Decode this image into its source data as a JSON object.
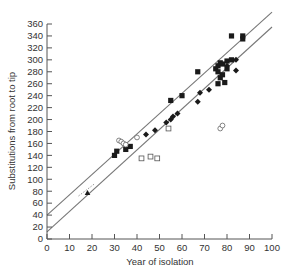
{
  "chart_data": {
    "type": "scatter",
    "title": "",
    "xlabel": "Year of isolation",
    "ylabel": "Substitutions from root to tip",
    "xlim": [
      0,
      100
    ],
    "ylim": [
      0,
      360
    ],
    "xticks": [
      0,
      10,
      20,
      30,
      40,
      50,
      60,
      70,
      80,
      90,
      100
    ],
    "yticks": [
      0,
      20,
      40,
      60,
      80,
      100,
      120,
      140,
      160,
      180,
      200,
      220,
      240,
      260,
      280,
      300,
      320,
      340,
      360
    ],
    "grid": false,
    "legend": null,
    "lines": [
      {
        "name": "upper-bound",
        "x": [
          0,
          100
        ],
        "y": [
          40,
          380
        ]
      },
      {
        "name": "lower-bound",
        "x": [
          0,
          100
        ],
        "y": [
          12,
          355
        ]
      }
    ],
    "series": [
      {
        "name": "filled-squares",
        "marker": "square-filled",
        "points": [
          [
            30,
            140
          ],
          [
            31,
            147
          ],
          [
            35,
            150
          ],
          [
            37,
            155
          ],
          [
            55,
            232
          ],
          [
            60,
            240
          ],
          [
            67,
            280
          ],
          [
            75,
            285
          ],
          [
            76,
            290
          ],
          [
            77,
            295
          ],
          [
            78,
            293
          ],
          [
            80,
            298
          ],
          [
            82,
            300
          ],
          [
            82,
            340
          ],
          [
            87,
            335
          ],
          [
            87,
            340
          ],
          [
            76,
            280
          ],
          [
            77,
            270
          ],
          [
            78,
            275
          ],
          [
            79,
            262
          ],
          [
            76,
            260
          ],
          [
            80,
            285
          ]
        ]
      },
      {
        "name": "filled-diamonds",
        "marker": "diamond-filled",
        "points": [
          [
            44,
            175
          ],
          [
            48,
            182
          ],
          [
            53,
            195
          ],
          [
            55,
            200
          ],
          [
            56,
            205
          ],
          [
            58,
            210
          ],
          [
            67,
            230
          ],
          [
            68,
            245
          ],
          [
            72,
            250
          ],
          [
            80,
            290
          ],
          [
            84,
            300
          ],
          [
            84,
            282
          ]
        ]
      },
      {
        "name": "open-circles",
        "marker": "circle-open",
        "points": [
          [
            32,
            165
          ],
          [
            33,
            163
          ],
          [
            34,
            160
          ],
          [
            35,
            158
          ],
          [
            40,
            170
          ],
          [
            77,
            185
          ],
          [
            78,
            190
          ]
        ]
      },
      {
        "name": "open-squares",
        "marker": "square-open",
        "points": [
          [
            42,
            135
          ],
          [
            46,
            138
          ],
          [
            49,
            135
          ],
          [
            54,
            185
          ]
        ]
      },
      {
        "name": "filled-triangle",
        "marker": "triangle-filled",
        "points": [
          [
            18,
            77
          ]
        ]
      },
      {
        "name": "dotted-segment",
        "marker": "dotted-line",
        "points": [
          [
            14,
            72
          ],
          [
            21,
            92
          ]
        ]
      }
    ]
  }
}
